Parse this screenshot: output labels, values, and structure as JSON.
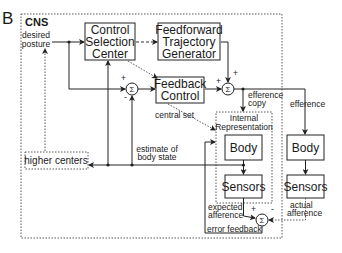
{
  "panel_label": "B",
  "cns_label": "CNS",
  "inputs": {
    "desired_posture_line1": "desired",
    "desired_posture_line2": "posture"
  },
  "boxes": {
    "control_selection": [
      "Control",
      "Selection",
      "Center"
    ],
    "feedforward": [
      "Feedforward",
      "Trajectory",
      "Generator"
    ],
    "feedback": [
      "Feedback",
      "Control"
    ],
    "internal_representation": [
      "Internal",
      "Representation"
    ],
    "internal_body": "Body",
    "internal_sensors": "Sensors",
    "real_body": "Body",
    "real_sensors": "Sensors",
    "higher_centers": "higher centers"
  },
  "summing_junctions": {
    "symbol": "Σ",
    "plus": "+",
    "minus": "-"
  },
  "labels": {
    "efference_copy_1": "efference",
    "efference_copy_2": "copy",
    "efference": "efference",
    "central_set": "central set",
    "estimate_1": "estimate of",
    "estimate_2": "body state",
    "expected_1": "expected",
    "expected_2": "afference",
    "actual_1": "actual",
    "actual_2": "afference",
    "error_feedback": "error feedback"
  }
}
